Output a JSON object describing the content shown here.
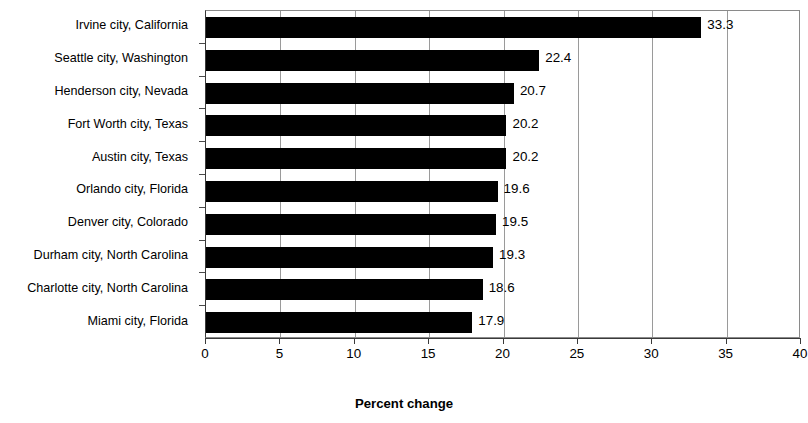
{
  "chart_data": {
    "type": "bar",
    "orientation": "horizontal",
    "title": "",
    "xlabel": "Percent change",
    "ylabel": "",
    "xlim": [
      0,
      40
    ],
    "xticks": [
      0,
      5,
      10,
      15,
      20,
      25,
      30,
      35,
      40
    ],
    "xtick_labels": [
      "0",
      "5",
      "10",
      "15",
      "20",
      "25",
      "30",
      "35",
      "40"
    ],
    "grid": "vertical",
    "legend": null,
    "bar_color": "#000000",
    "categories": [
      "Irvine city, California",
      "Seattle city, Washington",
      "Henderson city, Nevada",
      "Fort Worth city, Texas",
      "Austin city, Texas",
      "Orlando city, Florida",
      "Denver city, Colorado",
      "Durham city, North Carolina",
      "Charlotte city, North Carolina",
      "Miami city, Florida"
    ],
    "values": [
      33.3,
      22.4,
      20.7,
      20.2,
      20.2,
      19.6,
      19.5,
      19.3,
      18.6,
      17.9
    ],
    "value_labels": [
      "33.3",
      "22.4",
      "20.7",
      "20.2",
      "20.2",
      "19.6",
      "19.5",
      "19.3",
      "18.6",
      "17.9"
    ]
  }
}
